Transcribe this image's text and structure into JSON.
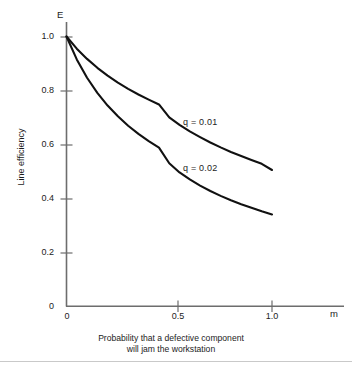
{
  "chart_data": {
    "type": "line",
    "title": "",
    "xlabel": "Probability that a defective component will jam the workstation",
    "ylabel": "Line efficiency",
    "x_axis_symbol": "m",
    "y_axis_symbol": "E",
    "xlim": [
      0,
      1.16
    ],
    "ylim": [
      0,
      1.0
    ],
    "grid": false,
    "legend_position": "inline-right-of-curves",
    "xticks": [
      {
        "value": 0,
        "label": "0"
      },
      {
        "value": 0.5,
        "label": "0.5"
      },
      {
        "value": 1.0,
        "label": "1.0"
      }
    ],
    "yticks": [
      {
        "value": 0,
        "label": "0"
      },
      {
        "value": 0.2,
        "label": "0.2"
      },
      {
        "value": 0.4,
        "label": "0.4"
      },
      {
        "value": 0.6,
        "label": "0.6"
      },
      {
        "value": 0.8,
        "label": "0.8"
      },
      {
        "value": 1.0,
        "label": "1.0"
      }
    ],
    "x": [
      0,
      0.05,
      0.1,
      0.15,
      0.2,
      0.25,
      0.3,
      0.35,
      0.4,
      0.45,
      0.5,
      0.55,
      0.6,
      0.65,
      0.7,
      0.75,
      0.8,
      0.85,
      0.9,
      0.95,
      1.0
    ],
    "series": [
      {
        "name": "q = 0.01",
        "label": "q = 0.01",
        "color": "#111111",
        "values": [
          1.0,
          0.955,
          0.917,
          0.884,
          0.855,
          0.829,
          0.806,
          0.785,
          0.766,
          0.748,
          0.7,
          0.672,
          0.648,
          0.627,
          0.607,
          0.589,
          0.572,
          0.557,
          0.542,
          0.528,
          0.505
        ]
      },
      {
        "name": "q = 0.02",
        "label": "q = 0.02",
        "color": "#111111",
        "values": [
          1.0,
          0.915,
          0.847,
          0.791,
          0.744,
          0.704,
          0.669,
          0.639,
          0.612,
          0.588,
          0.53,
          0.496,
          0.47,
          0.447,
          0.427,
          0.409,
          0.393,
          0.378,
          0.365,
          0.352,
          0.34
        ]
      }
    ]
  },
  "caption": {
    "line1": "Probability that a defective component",
    "line2": "will jam the workstation"
  }
}
